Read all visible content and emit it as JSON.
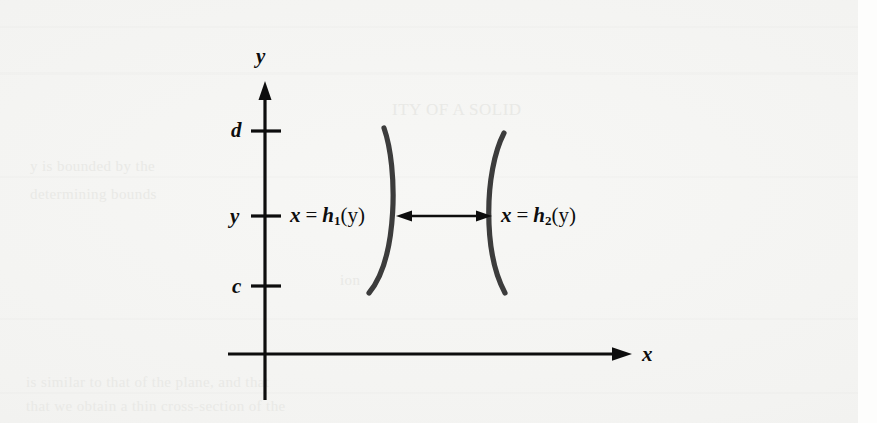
{
  "figure": {
    "type": "math-diagram",
    "axes": {
      "x_axis_label": "x",
      "y_axis_label": "y",
      "x_axis": {
        "start_px": 228,
        "end_px": 630,
        "y_px": 354,
        "arrow": "right"
      },
      "y_axis": {
        "x_px": 265,
        "top_px": 83,
        "bottom_px": 400,
        "arrow": "up"
      }
    },
    "ticks": [
      {
        "label": "d",
        "y_px": 131
      },
      {
        "label": "y",
        "y_px": 216
      },
      {
        "label": "c",
        "y_px": 286
      }
    ],
    "curves": [
      {
        "name": "left-boundary",
        "label_var": "x",
        "label_op": "=",
        "label_fn": "h",
        "label_sub": "1",
        "label_arg": "(y)",
        "bulge": "right"
      },
      {
        "name": "right-boundary",
        "label_var": "x",
        "label_op": "=",
        "label_fn": "h",
        "label_sub": "2",
        "label_arg": "(y)",
        "bulge": "left"
      }
    ],
    "arrow": {
      "name": "width-double-arrow",
      "y_px": 216,
      "from_px": 398,
      "to_px": 490,
      "heads": "both"
    },
    "colors": {
      "ink": "#0d0d0d",
      "curve": "#3a3a3a",
      "paper": "#f4f4f2",
      "ghost": "#e9e9e6"
    }
  },
  "ghost_text": {
    "line1": "ITY OF A SOLID",
    "line2": "y is bounded by the",
    "line3": "determining bounds",
    "line4": "ion",
    "line5": "is similar to that of the plane, and that",
    "line6": "that we obtain a thin cross-section of the"
  }
}
